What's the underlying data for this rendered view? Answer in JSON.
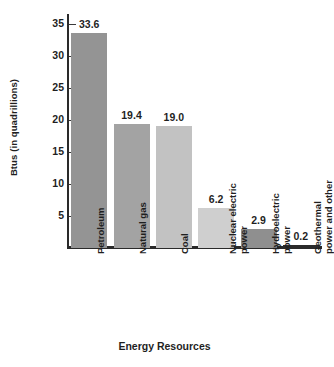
{
  "chart_data": {
    "type": "bar",
    "title": "",
    "xlabel": "Energy Resources",
    "ylabel": "Btus (in quadrillions)",
    "categories": [
      "Petroleum",
      "Natural gas",
      "Coal",
      "Nuclear electric power",
      "Hydroelectric power",
      "Geothermal power and other"
    ],
    "category_lines": [
      [
        "Petroleum"
      ],
      [
        "Natural gas"
      ],
      [
        "Coal"
      ],
      [
        "Nuclear electric",
        "power"
      ],
      [
        "Hydroelectric",
        "power"
      ],
      [
        "Geothermal",
        "power and other"
      ]
    ],
    "values": [
      33.6,
      19.4,
      19.0,
      6.2,
      2.9,
      0.2
    ],
    "value_labels": [
      "33.6",
      "19.4",
      "19.0",
      "6.2",
      "2.9",
      "0.2"
    ],
    "bar_colors": [
      "#949494",
      "#a3a3a3",
      "#c2c2c2",
      "#cfcfcf",
      "#8f8f8f",
      "#2b2b2b"
    ],
    "ylim": [
      0,
      36.5
    ],
    "yticks": [
      5,
      10,
      15,
      20,
      25,
      30,
      35
    ],
    "ytick_labels": [
      "5",
      "10",
      "15",
      "20",
      "25",
      "30",
      "35"
    ],
    "grid": false,
    "legend": false
  },
  "axes": {
    "y_title": "Btus (in quadrillions)",
    "x_title": "Energy Resources"
  }
}
